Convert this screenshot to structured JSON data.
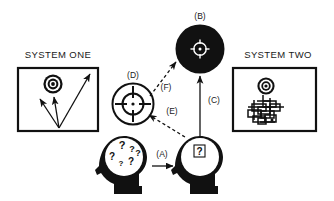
{
  "figure": {
    "background_color": "#ffffff",
    "ink_color": "#111111",
    "width": 334,
    "height": 201
  },
  "panels": {
    "system_one": {
      "title": "SYSTEM ONE",
      "contents_description": "target with three diverging arrows"
    },
    "system_two": {
      "title": "SYSTEM TWO",
      "contents_description": "target above interlocking rectangular maze"
    }
  },
  "nodes": {
    "filled_target": {
      "ref": "(B)",
      "kind": "filled-circle-crosshair"
    },
    "outline_crosshair": {
      "ref": "(D)",
      "kind": "outline-circle-crosshair"
    },
    "confused_head": {
      "kind": "head-silhouette-many-questions",
      "question_mark": "?",
      "question_count": 6
    },
    "resolved_head": {
      "kind": "head-silhouette-single-question",
      "question_mark": "?"
    }
  },
  "connectors": [
    {
      "ref": "(A)",
      "style": "solid",
      "from": "confused_head",
      "to": "resolved_head",
      "direction": "right"
    },
    {
      "ref": "(C)",
      "style": "solid",
      "from": "resolved_head",
      "to": "filled_target",
      "direction": "up"
    },
    {
      "ref": "(E)",
      "style": "dashed",
      "from": "resolved_head",
      "to": "outline_crosshair",
      "direction": "up-left"
    },
    {
      "ref": "(F)",
      "style": "dashed",
      "from": "outline_crosshair",
      "to": "filled_target",
      "direction": "up-right"
    }
  ],
  "labels": {
    "a": "(A)",
    "b": "(B)",
    "c": "(C)",
    "d": "(D)",
    "e": "(E)",
    "f": "(F)",
    "system_one": "SYSTEM ONE",
    "system_two": "SYSTEM TWO",
    "question": "?"
  }
}
